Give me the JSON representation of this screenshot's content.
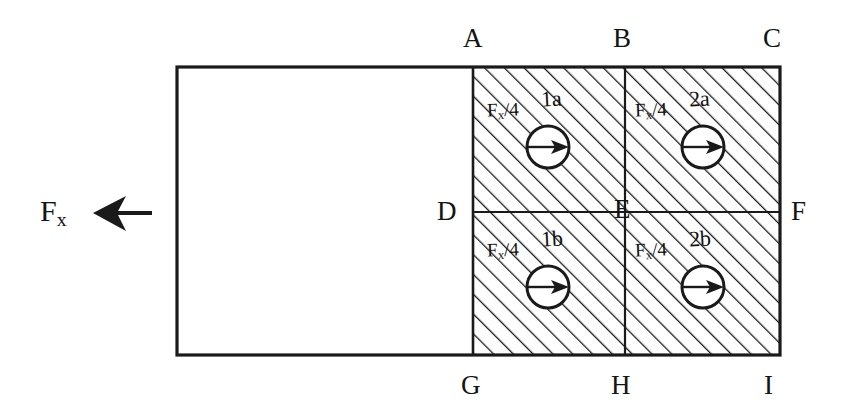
{
  "diagram": {
    "stroke_color": "#1a1a1a",
    "hatch_color": "#1a1a1a",
    "background_color": "#ffffff",
    "applied_force": {
      "label_text": "F",
      "label_subscript": "x",
      "arrow_direction": "left",
      "arrow_name": "resultant-force-arrow"
    },
    "node_labels": [
      {
        "id": "A",
        "text": "A",
        "x": 463,
        "y": 25
      },
      {
        "id": "B",
        "text": "B",
        "x": 613,
        "y": 25
      },
      {
        "id": "C",
        "text": "C",
        "x": 763,
        "y": 25
      },
      {
        "id": "D",
        "text": "D",
        "x": 437,
        "y": 198
      },
      {
        "id": "E",
        "text": "E",
        "x": 614,
        "y": 196
      },
      {
        "id": "F",
        "text": "F",
        "x": 791,
        "y": 198
      },
      {
        "id": "G",
        "text": "G",
        "x": 461,
        "y": 372
      },
      {
        "id": "H",
        "text": "H",
        "x": 611,
        "y": 372
      },
      {
        "id": "I",
        "text": "I",
        "x": 764,
        "y": 372
      }
    ],
    "quadrants": [
      {
        "name": "1a",
        "force_numerator": "F",
        "force_subscript": "x",
        "force_denominator": "4",
        "force_text": "/4",
        "label_x": 487,
        "label_y": 100,
        "name_x": 541,
        "name_y": 88,
        "circle_cx": 548,
        "circle_cy": 147,
        "circle_r": 21,
        "arrow_direction": "right"
      },
      {
        "name": "2a",
        "force_numerator": "F",
        "force_subscript": "x",
        "force_denominator": "4",
        "force_text": "/4",
        "label_x": 635,
        "label_y": 100,
        "name_x": 689,
        "name_y": 88,
        "circle_cx": 703,
        "circle_cy": 147,
        "circle_r": 21,
        "arrow_direction": "right"
      },
      {
        "name": "1b",
        "force_numerator": "F",
        "force_subscript": "x",
        "force_denominator": "4",
        "force_text": "/4",
        "label_x": 487,
        "label_y": 240,
        "name_x": 541,
        "name_y": 228,
        "circle_cx": 548,
        "circle_cy": 287,
        "circle_r": 21,
        "arrow_direction": "right"
      },
      {
        "name": "2b",
        "force_numerator": "F",
        "force_subscript": "x",
        "force_denominator": "4",
        "force_text": "/4",
        "label_x": 635,
        "label_y": 240,
        "name_x": 689,
        "name_y": 228,
        "circle_cx": 703,
        "circle_cy": 287,
        "circle_r": 21,
        "arrow_direction": "right"
      }
    ],
    "geometry": {
      "outer_left": 177,
      "outer_top": 67,
      "outer_right": 780,
      "outer_bottom": 355,
      "divider_left_x": 473,
      "divider_mid_x": 625,
      "divider_mid_y": 212
    }
  }
}
